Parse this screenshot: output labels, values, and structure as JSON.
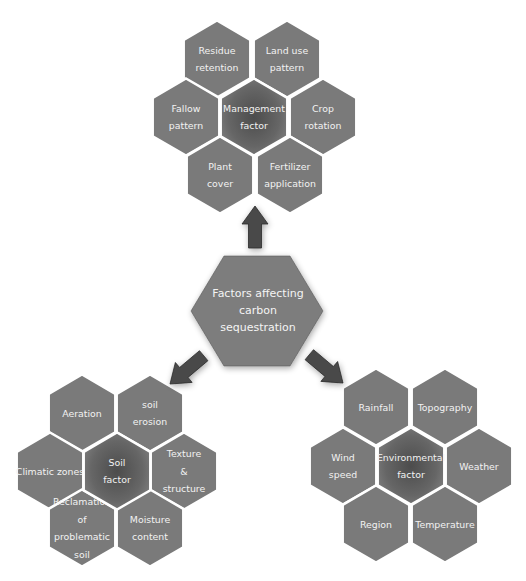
{
  "colors": {
    "hex_fill": "#7a7a7a",
    "hex_center_fill": "#5e5e5e",
    "text": "#f2f2f2",
    "arrow": "#4a4a4a",
    "background": "#ffffff"
  },
  "center": {
    "lines": [
      "Factors affecting",
      "carbon",
      "sequestration"
    ]
  },
  "clusters": [
    {
      "id": "management",
      "center_label": [
        "Management",
        "factor"
      ],
      "items": [
        {
          "id": "residue",
          "lines": [
            "Residue",
            "retention"
          ]
        },
        {
          "id": "land-use",
          "lines": [
            "Land use",
            "pattern"
          ]
        },
        {
          "id": "fallow",
          "lines": [
            "Fallow",
            "pattern"
          ]
        },
        {
          "id": "crop",
          "lines": [
            "Crop",
            "rotation"
          ]
        },
        {
          "id": "plant-cover",
          "lines": [
            "Plant",
            "cover"
          ]
        },
        {
          "id": "fertilizer",
          "lines": [
            "Fertilizer",
            "application"
          ]
        }
      ]
    },
    {
      "id": "soil",
      "center_label": [
        "Soil",
        "factor"
      ],
      "items": [
        {
          "id": "aeration",
          "lines": [
            "Aeration"
          ]
        },
        {
          "id": "soil-erosion",
          "lines": [
            "soil",
            "erosion"
          ]
        },
        {
          "id": "climatic-zones",
          "lines": [
            "Climatic zones"
          ]
        },
        {
          "id": "texture",
          "lines": [
            "Texture",
            "&",
            "structure"
          ]
        },
        {
          "id": "reclamation",
          "lines": [
            "Reclamation",
            "of",
            "problematic",
            "soil"
          ]
        },
        {
          "id": "moisture",
          "lines": [
            "Moisture",
            "content"
          ]
        }
      ]
    },
    {
      "id": "environmental",
      "center_label": [
        "Environmental",
        "factor"
      ],
      "items": [
        {
          "id": "rainfall",
          "lines": [
            "Rainfall"
          ]
        },
        {
          "id": "topography",
          "lines": [
            "Topography"
          ]
        },
        {
          "id": "wind-speed",
          "lines": [
            "Wind",
            "speed"
          ]
        },
        {
          "id": "weather",
          "lines": [
            "Weather"
          ]
        },
        {
          "id": "region",
          "lines": [
            "Region"
          ]
        },
        {
          "id": "temperature",
          "lines": [
            "Temperature"
          ]
        }
      ]
    }
  ]
}
